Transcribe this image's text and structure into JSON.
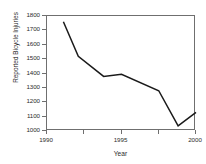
{
  "chart_data": {
    "type": "line",
    "title": "",
    "xlabel": "Year",
    "ylabel": "Reported Bicycle Injuries",
    "xlim": [
      1990,
      2000
    ],
    "ylim": [
      1000,
      1800
    ],
    "grid": false,
    "legend": null,
    "x_ticks": [
      1990,
      1992.5,
      1995,
      1997.5,
      2000
    ],
    "x_tick_labels": [
      "1990",
      "",
      "1995",
      "",
      "2000"
    ],
    "y_ticks": [
      1000,
      1100,
      1200,
      1300,
      1400,
      1500,
      1600,
      1700,
      1800
    ],
    "y_tick_labels": [
      "1000",
      "1100",
      "1200",
      "1300",
      "1400",
      "1500",
      "1600",
      "1700",
      "1800"
    ],
    "series": [
      {
        "name": "Reported Bicycle Injuries",
        "color": "#1a1a1a",
        "x": [
          1991.1,
          1992.1,
          1993.8,
          1995.0,
          1997.5,
          1998.8,
          2000.0
        ],
        "values": [
          1760,
          1520,
          1380,
          1395,
          1280,
          1035,
          1130
        ]
      }
    ]
  },
  "axes": {
    "frame_color": "#6f6f6f",
    "line_color": "#1a1a1a",
    "background": "#ffffff"
  }
}
